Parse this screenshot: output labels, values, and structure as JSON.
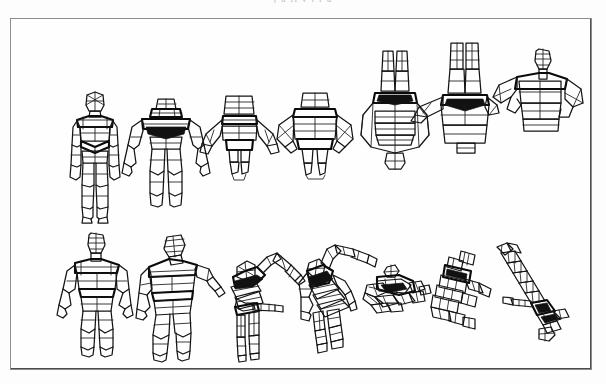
{
  "page": {
    "width": 606,
    "height": 384,
    "background_color": "#fdfdfd",
    "top_caption": "j u ii v i i u"
  },
  "frame": {
    "x": 10,
    "y": 18,
    "width": 582,
    "height": 352,
    "border_color": "#8d8d8d",
    "shadow_color": "#4d4d4d",
    "fill_color": "#fefefe"
  },
  "figure": {
    "kind": "wireframe-human-pose-grid",
    "line_color": "#141414",
    "rows": 2,
    "columns": 7,
    "total_poses": 14,
    "row_labels": [
      "top-row",
      "bottom-row"
    ],
    "poses": [
      {
        "id": "pose-1",
        "row": 1,
        "col": 1,
        "name": "front-upright",
        "view": "front elevation, standing",
        "cx": 78,
        "cy": 140,
        "scale": 1.0,
        "rotation_deg": 0
      },
      {
        "id": "pose-2",
        "row": 1,
        "col": 2,
        "name": "front-tilted-down",
        "view": "elevated camera, slight pitch",
        "cx": 157,
        "cy": 132,
        "scale": 0.98,
        "rotation_deg": 15
      },
      {
        "id": "pose-3",
        "row": 1,
        "col": 3,
        "name": "top-oblique-near",
        "view": "high oblique, legs foreshortened",
        "cx": 232,
        "cy": 122,
        "scale": 0.92,
        "rotation_deg": 35
      },
      {
        "id": "pose-4",
        "row": 1,
        "col": 4,
        "name": "top-oblique-wide",
        "view": "higher oblique, arms splayed",
        "cx": 308,
        "cy": 118,
        "scale": 0.95,
        "rotation_deg": 50
      },
      {
        "id": "pose-5",
        "row": 1,
        "col": 5,
        "name": "top-down-lantern",
        "view": "near top-down, torso foreshortened",
        "cx": 385,
        "cy": 103,
        "scale": 1.0,
        "rotation_deg": 65
      },
      {
        "id": "pose-6",
        "row": 1,
        "col": 6,
        "name": "top-down-steep",
        "view": "steep top-down, legs toward viewer",
        "cx": 455,
        "cy": 95,
        "scale": 1.0,
        "rotation_deg": 78
      },
      {
        "id": "pose-7",
        "row": 1,
        "col": 7,
        "name": "overhead-torso",
        "view": "overhead, head and shoulders only",
        "cx": 529,
        "cy": 95,
        "scale": 0.95,
        "rotation_deg": 90
      },
      {
        "id": "pose-8",
        "row": 2,
        "col": 1,
        "name": "three-quarter-standing",
        "view": "three-quarter front, standing",
        "cx": 85,
        "cy": 278,
        "scale": 1.0,
        "rotation_deg": 0
      },
      {
        "id": "pose-9",
        "row": 2,
        "col": 2,
        "name": "leaning-forward",
        "view": "leaning forward, arm extended",
        "cx": 160,
        "cy": 278,
        "scale": 1.0,
        "rotation_deg": 20
      },
      {
        "id": "pose-10",
        "row": 2,
        "col": 3,
        "name": "bent-over-reaching",
        "view": "bent at waist, arm reaching out",
        "cx": 243,
        "cy": 280,
        "scale": 1.0,
        "rotation_deg": 40
      },
      {
        "id": "pose-11",
        "row": 2,
        "col": 4,
        "name": "bent-over-steep",
        "view": "steeper bend, torso near horizontal",
        "cx": 318,
        "cy": 275,
        "scale": 1.0,
        "rotation_deg": 55
      },
      {
        "id": "pose-12",
        "row": 2,
        "col": 5,
        "name": "horizontal-compressed",
        "view": "body horizontal, heavy foreshorten",
        "cx": 391,
        "cy": 283,
        "scale": 0.9,
        "rotation_deg": 72
      },
      {
        "id": "pose-13",
        "row": 2,
        "col": 6,
        "name": "diagonal-collapsed",
        "view": "diagonal, strongly foreshortened",
        "cx": 456,
        "cy": 278,
        "scale": 0.95,
        "rotation_deg": 82
      },
      {
        "id": "pose-14",
        "row": 2,
        "col": 7,
        "name": "receding-diagonal",
        "view": "receding diagonal, feet toward viewer",
        "cx": 530,
        "cy": 278,
        "scale": 1.0,
        "rotation_deg": 90
      }
    ]
  }
}
